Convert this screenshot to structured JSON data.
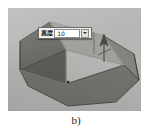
{
  "figure": {
    "caption": "b)",
    "canvas_color": "#b6b6b4"
  },
  "viewport": {
    "name": "cad-3d-viewport",
    "background_color": "#b6b6b4"
  },
  "model": {
    "shape_name": "trapezoidal-prism",
    "description": "Isometric truncated wedge solid",
    "face_top_color": "#9c9c99",
    "face_front_color": "#6e6e6c",
    "face_left_color": "#5e5e5c",
    "face_right_color": "#7f7f7d",
    "edge_color": "#3b3b3a",
    "highlight_edge_color": "#d8d8d4"
  },
  "extrude_arrow": {
    "name": "extrude-direction-arrow",
    "color": "#4a4a48"
  },
  "dialog": {
    "name": "height-input-dialog",
    "label": "高度",
    "value": "10",
    "dropdown_icon": "chevron-down-icon",
    "background_color": "#f3f2ee",
    "border_color": "#6a6a68"
  }
}
